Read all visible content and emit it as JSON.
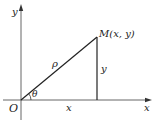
{
  "diagram": {
    "type": "polar-coordinates",
    "labels": {
      "y_axis": "y",
      "x_axis": "x",
      "origin": "O",
      "point": "M(x, y)",
      "radius": "ρ",
      "angle": "θ",
      "vertical_leg": "y",
      "horizontal_leg": "x"
    },
    "colors": {
      "line": "#222222",
      "axis": "#555555",
      "background": "#ffffff"
    }
  }
}
